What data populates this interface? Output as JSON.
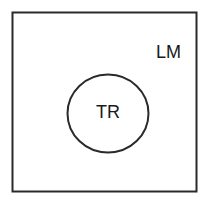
{
  "diagram": {
    "type": "venn-subset",
    "outer_set": {
      "label": "LM",
      "shape": "rectangle"
    },
    "inner_set": {
      "label": "TR",
      "shape": "circle"
    },
    "stroke_color": "#2a2a2a",
    "background": "#ffffff"
  }
}
